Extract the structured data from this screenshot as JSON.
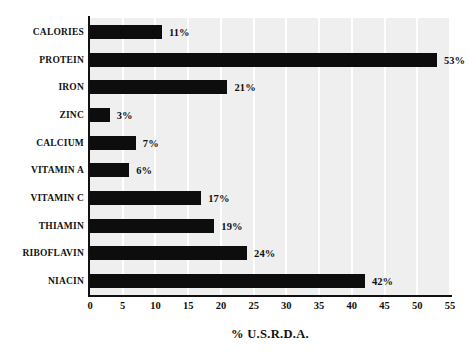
{
  "chart_data": {
    "type": "bar",
    "orientation": "horizontal",
    "title": "",
    "xlabel": "% U.S.R.D.A.",
    "ylabel": "",
    "xlim": [
      0,
      55
    ],
    "xticks": [
      0,
      5,
      10,
      15,
      20,
      25,
      30,
      35,
      40,
      45,
      50,
      55
    ],
    "xtick_labels": [
      "0",
      "5",
      "10",
      "15",
      "20",
      "25",
      "30",
      "35",
      "40",
      "45",
      "50",
      "55"
    ],
    "grid": "vertical-white-gridlines",
    "legend": "none",
    "categories": [
      "CALORIES",
      "PROTEIN",
      "IRON",
      "ZINC",
      "CALCIUM",
      "VITAMIN A",
      "VITAMIN C",
      "THIAMIN",
      "RIBOFLAVIN",
      "NIACIN"
    ],
    "values": [
      11,
      53,
      21,
      3,
      7,
      6,
      17,
      19,
      24,
      42
    ],
    "data_labels": [
      "11%",
      "21%",
      "3%",
      "7%",
      "6%",
      "17%",
      "19%",
      "24%",
      "42%",
      "53%"
    ],
    "bars": [
      {
        "category": "CALORIES",
        "value": 11,
        "label": "11%"
      },
      {
        "category": "PROTEIN",
        "value": 53,
        "label": "53%"
      },
      {
        "category": "IRON",
        "value": 21,
        "label": "21%"
      },
      {
        "category": "ZINC",
        "value": 3,
        "label": "3%"
      },
      {
        "category": "CALCIUM",
        "value": 7,
        "label": "7%"
      },
      {
        "category": "VITAMIN A",
        "value": 6,
        "label": "6%"
      },
      {
        "category": "VITAMIN C",
        "value": 17,
        "label": "17%"
      },
      {
        "category": "THIAMIN",
        "value": 19,
        "label": "19%"
      },
      {
        "category": "RIBOFLAVIN",
        "value": 24,
        "label": "24%"
      },
      {
        "category": "NIACIN",
        "value": 42,
        "label": "42%"
      }
    ]
  },
  "colors": {
    "bar": "#0d0d0d",
    "plot_background": "#efefef",
    "gridline": "#ffffff",
    "axis": "#111111",
    "text": "#111111",
    "page_background": "#ffffff"
  }
}
